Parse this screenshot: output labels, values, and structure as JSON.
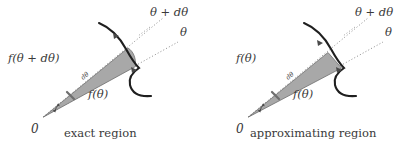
{
  "diagram": {
    "background_color": "#ffffff",
    "ink_color": "#3a3a3a",
    "curve_color": "#1f1f1f",
    "wedge_fill_color": "#a8a8a8",
    "wedge_stroke_color": "#6e6e6e",
    "ray_color": "#8c8c8c",
    "panels": [
      {
        "id": "exact",
        "caption": "exact region",
        "origin_label": "0",
        "outer_ray_label": "θ + dθ",
        "inner_ray_label": "θ",
        "upper_radius_label": "f(θ + dθ)",
        "lower_radius_label": "f(θ)",
        "angle_label": "dθ",
        "outer_edge_kind": "curved"
      },
      {
        "id": "approx",
        "caption": "approximating region",
        "origin_label": "0",
        "outer_ray_label": "θ + dθ",
        "inner_ray_label": "θ",
        "upper_radius_label": "f(θ)",
        "lower_radius_label": "f(θ)",
        "angle_label": "dθ",
        "outer_edge_kind": "straight"
      }
    ]
  }
}
